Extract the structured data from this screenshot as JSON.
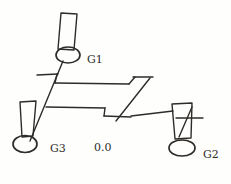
{
  "diagram": {
    "colors": {
      "ink": "#2e2c29",
      "paper": "#fefefdff"
    },
    "labels": {
      "g1": "G1",
      "g2": "G2",
      "g3": "G3",
      "reading": "0.0"
    }
  }
}
